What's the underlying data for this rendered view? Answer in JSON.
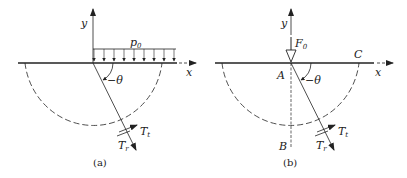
{
  "panels": [
    {
      "id": "a",
      "caption": "(a)",
      "labels": {
        "y_axis": "y",
        "x_axis": "x",
        "load": "p",
        "load_sub": "0",
        "angle": "−θ",
        "tangential": "T",
        "tangential_sub": "t",
        "radial": "T",
        "radial_sub": "r"
      }
    },
    {
      "id": "b",
      "caption": "(b)",
      "labels": {
        "y_axis": "y",
        "x_axis": "x",
        "force": "F",
        "force_sub": "0",
        "angle": "−θ",
        "tangential": "T",
        "tangential_sub": "t",
        "radial": "T",
        "radial_sub": "r",
        "point_a": "A",
        "point_b": "B",
        "point_c": "C"
      }
    }
  ],
  "colors": {
    "stroke": "#222222",
    "background": "#ffffff"
  }
}
